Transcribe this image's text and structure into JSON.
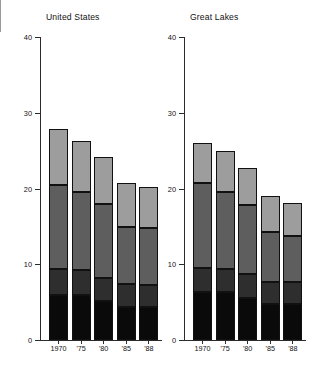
{
  "figure": {
    "caption_top": "",
    "axis": {
      "y_ticks": [
        0,
        10,
        20,
        30,
        40
      ],
      "y_min": 0,
      "y_max": 40,
      "x_categories": [
        "1970",
        "'75",
        "'80",
        "'85",
        "'88"
      ]
    }
  },
  "chart_data": {
    "type": "bar",
    "title": "",
    "subtitle": "",
    "xlabel": "",
    "ylabel": "",
    "ylim": [
      0,
      40
    ],
    "grid": false,
    "legend": "none",
    "stacked": true,
    "panels": [
      {
        "title": "United States",
        "categories": [
          "1970",
          "'75",
          "'80",
          "'85",
          "'88"
        ],
        "totals": [
          27.8,
          26.3,
          24.2,
          20.7,
          20.2
        ],
        "series": [
          {
            "name": "segment-1-bottom",
            "color": "#0a0a0a",
            "values": [
              6.0,
              6.0,
              5.2,
              4.4,
              4.3
            ]
          },
          {
            "name": "segment-2",
            "color": "#2e2e2e",
            "values": [
              3.4,
              3.3,
              3.0,
              3.0,
              3.0
            ]
          },
          {
            "name": "segment-3",
            "color": "#5e5e5e",
            "values": [
              11.1,
              10.2,
              9.8,
              7.5,
              7.5
            ]
          },
          {
            "name": "segment-4-top",
            "color": "#9d9d9d",
            "values": [
              7.3,
              6.8,
              6.2,
              5.8,
              5.4
            ]
          }
        ]
      },
      {
        "title": "Great Lakes",
        "categories": [
          "1970",
          "'75",
          "'80",
          "'85",
          "'88"
        ],
        "totals": [
          26.0,
          24.9,
          22.7,
          19.0,
          18.1
        ],
        "series": [
          {
            "name": "segment-1-bottom",
            "color": "#0a0a0a",
            "values": [
              6.4,
              6.3,
              5.5,
              4.8,
              4.7
            ]
          },
          {
            "name": "segment-2",
            "color": "#2e2e2e",
            "values": [
              3.1,
              3.1,
              3.2,
              2.9,
              3.0
            ]
          },
          {
            "name": "segment-3",
            "color": "#5e5e5e",
            "values": [
              11.2,
              10.2,
              9.1,
              6.6,
              6.0
            ]
          },
          {
            "name": "segment-4-top",
            "color": "#9d9d9d",
            "values": [
              5.3,
              5.3,
              4.9,
              4.7,
              4.4
            ]
          }
        ]
      }
    ]
  }
}
